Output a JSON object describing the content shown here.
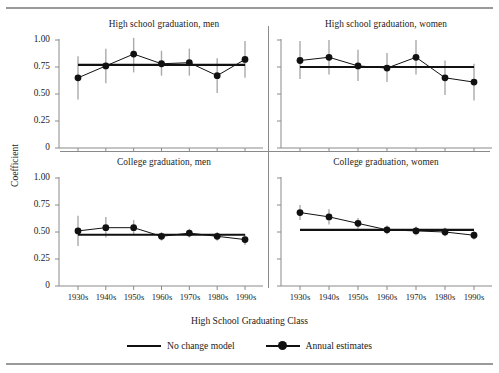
{
  "figure": {
    "y_axis_title": "Coefficient",
    "x_axis_title": "High School Graduating Class"
  },
  "legend": {
    "items": [
      {
        "label": "No change model",
        "marker": "line"
      },
      {
        "label": "Annual estimates",
        "marker": "line-with-dot"
      }
    ]
  },
  "axes": {
    "y_ticks": [
      "1.00",
      "0.75",
      "0.50",
      "0.25",
      "0"
    ],
    "y_values": [
      1.0,
      0.75,
      0.5,
      0.25,
      0
    ],
    "x_ticks": [
      "1930s",
      "1940s",
      "1950s",
      "1960s",
      "1970s",
      "1980s",
      "1990s"
    ]
  },
  "chart_data": {
    "type": "line",
    "title": "",
    "xlabel": "High School Graduating Class",
    "ylabel": "Coefficient",
    "ylim": [
      0,
      1.0
    ],
    "grid": false,
    "legend_position": "bottom",
    "categories": [
      "1930s",
      "1940s",
      "1950s",
      "1960s",
      "1970s",
      "1980s",
      "1990s"
    ],
    "panels": [
      {
        "title": "High school graduation, men",
        "position": "top-left",
        "series": [
          {
            "name": "Annual estimates",
            "values": [
              0.65,
              0.76,
              0.87,
              0.78,
              0.79,
              0.67,
              0.82
            ],
            "ci_low": [
              0.45,
              0.6,
              0.7,
              0.67,
              0.67,
              0.51,
              0.65
            ],
            "ci_high": [
              0.85,
              0.92,
              1.02,
              0.9,
              0.92,
              0.83,
              0.99
            ]
          },
          {
            "name": "No change model",
            "values": [
              0.77,
              0.77,
              0.77,
              0.77,
              0.77,
              0.77,
              0.77
            ]
          }
        ]
      },
      {
        "title": "High school graduation, women",
        "position": "top-right",
        "series": [
          {
            "name": "Annual estimates",
            "values": [
              0.81,
              0.84,
              0.76,
              0.74,
              0.84,
              0.65,
              0.61
            ],
            "ci_low": [
              0.64,
              0.68,
              0.62,
              0.61,
              0.68,
              0.49,
              0.44
            ],
            "ci_high": [
              0.99,
              1.0,
              0.91,
              0.88,
              1.0,
              0.81,
              0.78
            ]
          },
          {
            "name": "No change model",
            "values": [
              0.75,
              0.75,
              0.75,
              0.75,
              0.75,
              0.75,
              0.75
            ]
          }
        ]
      },
      {
        "title": "College graduation, men",
        "position": "bottom-left",
        "series": [
          {
            "name": "Annual estimates",
            "values": [
              0.51,
              0.54,
              0.54,
              0.46,
              0.49,
              0.46,
              0.43
            ],
            "ci_low": [
              0.37,
              0.45,
              0.47,
              0.42,
              0.45,
              0.42,
              0.38
            ],
            "ci_high": [
              0.65,
              0.64,
              0.61,
              0.5,
              0.53,
              0.5,
              0.48
            ]
          },
          {
            "name": "No change model",
            "values": [
              0.475,
              0.475,
              0.475,
              0.475,
              0.475,
              0.475,
              0.475
            ]
          }
        ]
      },
      {
        "title": "College graduation, women",
        "position": "bottom-right",
        "series": [
          {
            "name": "Annual estimates",
            "values": [
              0.68,
              0.64,
              0.58,
              0.52,
              0.51,
              0.5,
              0.47
            ],
            "ci_low": [
              0.61,
              0.57,
              0.53,
              0.48,
              0.47,
              0.46,
              0.43
            ],
            "ci_high": [
              0.75,
              0.71,
              0.63,
              0.56,
              0.55,
              0.54,
              0.51
            ]
          },
          {
            "name": "No change model",
            "values": [
              0.52,
              0.52,
              0.52,
              0.52,
              0.52,
              0.52,
              0.52
            ]
          }
        ]
      }
    ]
  }
}
